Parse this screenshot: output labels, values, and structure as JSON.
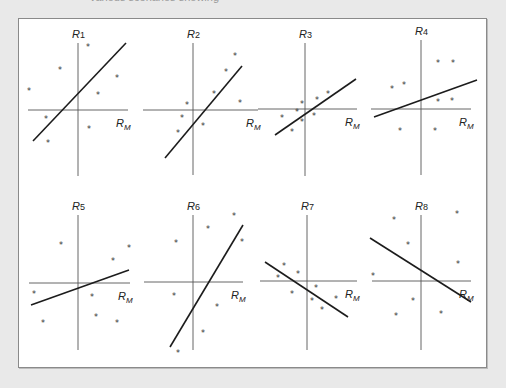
{
  "caption": "various scenarios showing",
  "chart_data": {
    "type": "scatter",
    "title": "",
    "layout": {
      "grid": "2x4 small multiples",
      "legend": "none",
      "gridlines": false
    },
    "x_axis_label": "R_M",
    "panels": [
      {
        "id": "R1",
        "ylabel": "R",
        "ysub": "1",
        "xlabel": "R",
        "xsub": "M",
        "axis_origin": [
          78,
          110
        ],
        "vaxis": [
          43,
          176
        ],
        "haxis": [
          28,
          128
        ],
        "fit_line": [
          [
            33,
            141
          ],
          [
            126,
            43
          ]
        ],
        "points": [
          [
            88,
            46
          ],
          [
            60,
            69
          ],
          [
            117,
            77
          ],
          [
            29,
            90
          ],
          [
            98,
            94
          ],
          [
            46,
            118
          ],
          [
            89,
            128
          ],
          [
            48,
            142
          ]
        ],
        "slope_sign": "positive"
      },
      {
        "id": "R2",
        "ylabel": "R",
        "ysub": "2",
        "xlabel": "R",
        "xsub": "M",
        "axis_origin": [
          193,
          110
        ],
        "vaxis": [
          43,
          175
        ],
        "haxis": [
          143,
          258
        ],
        "fit_line": [
          [
            165,
            158
          ],
          [
            242,
            66
          ]
        ],
        "points": [
          [
            235,
            55
          ],
          [
            226,
            71
          ],
          [
            214,
            93
          ],
          [
            187,
            104
          ],
          [
            240,
            102
          ],
          [
            182,
            117
          ],
          [
            203,
            125
          ],
          [
            178,
            132
          ]
        ],
        "slope_sign": "positive"
      },
      {
        "id": "R3",
        "ylabel": "R",
        "ysub": "3",
        "xlabel": "R",
        "xsub": "M",
        "axis_origin": [
          305,
          109
        ],
        "vaxis": [
          43,
          176
        ],
        "haxis": [
          258,
          357
        ],
        "fit_line": [
          [
            275,
            135
          ],
          [
            356,
            79
          ]
        ],
        "points": [
          [
            302,
            103
          ],
          [
            317,
            99
          ],
          [
            328,
            93
          ],
          [
            297,
            111
          ],
          [
            282,
            117
          ],
          [
            314,
            115
          ],
          [
            302,
            121
          ],
          [
            292,
            131
          ]
        ],
        "slope_sign": "positive"
      },
      {
        "id": "R4",
        "ylabel": "R",
        "ysub": "4",
        "xlabel": "R",
        "xsub": "M",
        "axis_origin": [
          421,
          109
        ],
        "vaxis": [
          40,
          175
        ],
        "haxis": [
          371,
          471
        ],
        "fit_line": [
          [
            374,
            117
          ],
          [
            477,
            80
          ]
        ],
        "points": [
          [
            438,
            62
          ],
          [
            453,
            62
          ],
          [
            392,
            88
          ],
          [
            404,
            84
          ],
          [
            438,
            101
          ],
          [
            452,
            100
          ],
          [
            400,
            130
          ],
          [
            435,
            130
          ]
        ],
        "slope_sign": "positive"
      },
      {
        "id": "R5",
        "ylabel": "R",
        "ysub": "5",
        "xlabel": "R",
        "xsub": "M",
        "axis_origin": [
          78,
          283
        ],
        "vaxis": [
          215,
          350
        ],
        "haxis": [
          29,
          130
        ],
        "fit_line": [
          [
            31,
            305
          ],
          [
            129,
            270
          ]
        ],
        "points": [
          [
            61,
            244
          ],
          [
            129,
            247
          ],
          [
            113,
            260
          ],
          [
            34,
            293
          ],
          [
            92,
            296
          ],
          [
            96,
            316
          ],
          [
            43,
            322
          ],
          [
            117,
            322
          ]
        ],
        "slope_sign": "positive"
      },
      {
        "id": "R6",
        "ylabel": "R",
        "ysub": "6",
        "xlabel": "R",
        "xsub": "M",
        "axis_origin": [
          193,
          282
        ],
        "vaxis": [
          215,
          350
        ],
        "haxis": [
          144,
          243
        ],
        "fit_line": [
          [
            170,
            347
          ],
          [
            243,
            225
          ]
        ],
        "points": [
          [
            234,
            215
          ],
          [
            208,
            228
          ],
          [
            176,
            242
          ],
          [
            242,
            241
          ],
          [
            174,
            295
          ],
          [
            217,
            306
          ],
          [
            203,
            332
          ],
          [
            178,
            352
          ]
        ],
        "slope_sign": "positive"
      },
      {
        "id": "R7",
        "ylabel": "R",
        "ysub": "7",
        "xlabel": "R",
        "xsub": "M",
        "axis_origin": [
          307,
          281
        ],
        "vaxis": [
          215,
          350
        ],
        "haxis": [
          260,
          357
        ],
        "fit_line": [
          [
            265,
            262
          ],
          [
            348,
            317
          ]
        ],
        "points": [
          [
            284,
            265
          ],
          [
            278,
            277
          ],
          [
            298,
            273
          ],
          [
            316,
            287
          ],
          [
            292,
            293
          ],
          [
            312,
            300
          ],
          [
            336,
            298
          ],
          [
            322,
            309
          ]
        ],
        "slope_sign": "negative"
      },
      {
        "id": "R8",
        "ylabel": "R",
        "ysub": "8",
        "xlabel": "R",
        "xsub": "M",
        "axis_origin": [
          421,
          281
        ],
        "vaxis": [
          215,
          350
        ],
        "haxis": [
          372,
          471
        ],
        "fit_line": [
          [
            370,
            238
          ],
          [
            471,
            302
          ]
        ],
        "points": [
          [
            457,
            213
          ],
          [
            394,
            219
          ],
          [
            408,
            244
          ],
          [
            458,
            263
          ],
          [
            373,
            275
          ],
          [
            413,
            300
          ],
          [
            396,
            315
          ],
          [
            441,
            313
          ]
        ],
        "slope_sign": "negative"
      }
    ]
  },
  "marker_glyph": "*"
}
